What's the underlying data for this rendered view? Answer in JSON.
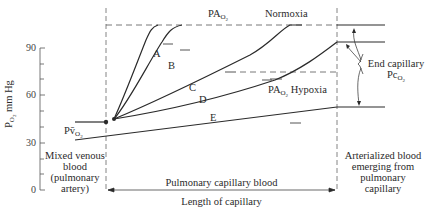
{
  "y_axis": {
    "label_main": "P",
    "label_sub": "O",
    "label_sub2": "2",
    "label_unit": " mm Hg",
    "ticks": [
      "90",
      "60",
      "30",
      "0"
    ]
  },
  "labels": {
    "pao2_top_main": "PA",
    "pao2_top_sub": "O",
    "pao2_top_sub2": "2",
    "normoxia": "Normoxia",
    "pao2_hypoxia_main": "PA",
    "pao2_hypoxia_sub": "O",
    "pao2_hypoxia_sub2": "2",
    "hypoxia": " Hypoxia",
    "pvo2_main": "Pv̄",
    "pvo2_sub": "O",
    "pvo2_sub2": "2",
    "curve_a": "A",
    "curve_b": "B",
    "curve_c": "C",
    "curve_d": "D",
    "curve_e": "E",
    "end_capillary_line1": "End capillary",
    "end_capillary_main": "Pc",
    "end_capillary_sub": "O",
    "end_capillary_sub2": "2",
    "mixed_venous": [
      "Mixed venous",
      "blood",
      "(pulmonary",
      "artery)"
    ],
    "arterialized": [
      "Arterialized blood",
      "emerging from",
      "pulmonary",
      "capillary"
    ],
    "pulmonary_capillary_blood": "Pulmonary capillary blood",
    "length_of_capillary": "Length of capillary"
  },
  "colors": {
    "line": "#2a2a2a",
    "dash": "#555555",
    "background": "#ffffff"
  }
}
